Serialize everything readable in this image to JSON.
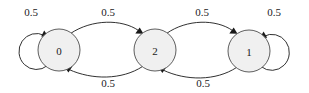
{
  "diagram": {
    "type": "state-transition-diagram",
    "title": "",
    "background_color": "#ffffff",
    "node_fill_color": "#f0f0f0",
    "node_stroke_color": "#4d4d4d",
    "edge_color": "#1a1a1a",
    "nodes": [
      {
        "id": "state-0",
        "label": "0",
        "cx": 59,
        "cy": 50,
        "r": 21
      },
      {
        "id": "state-2",
        "label": "2",
        "cx": 155,
        "cy": 50,
        "r": 21
      },
      {
        "id": "state-1",
        "label": "1",
        "cx": 249,
        "cy": 51,
        "r": 21
      }
    ],
    "edges": [
      {
        "id": "edge-0-0",
        "from": "0",
        "to": "0",
        "label": "0.5",
        "kind": "self-loop",
        "label_x": 31,
        "label_y": 12
      },
      {
        "id": "edge-0-2",
        "from": "0",
        "to": "2",
        "label": "0.5",
        "kind": "curve-top",
        "label_x": 108,
        "label_y": 12
      },
      {
        "id": "edge-2-0",
        "from": "2",
        "to": "0",
        "label": "0.5",
        "kind": "curve-bottom",
        "label_x": 108,
        "label_y": 83
      },
      {
        "id": "edge-2-1",
        "from": "2",
        "to": "1",
        "label": "0.5",
        "kind": "curve-top",
        "label_x": 202,
        "label_y": 12
      },
      {
        "id": "edge-1-2",
        "from": "1",
        "to": "2",
        "label": "0.5",
        "kind": "curve-bottom",
        "label_x": 203,
        "label_y": 83
      },
      {
        "id": "edge-1-1",
        "from": "1",
        "to": "1",
        "label": "0.5",
        "kind": "self-loop",
        "label_x": 274,
        "label_y": 12
      }
    ]
  }
}
